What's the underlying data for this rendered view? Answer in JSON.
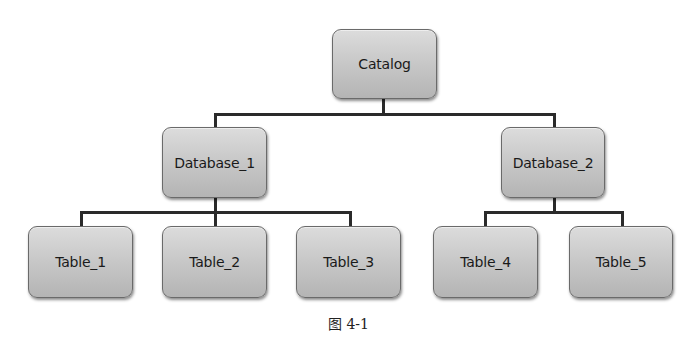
{
  "diagram": {
    "type": "tree",
    "root": {
      "label": "Catalog",
      "children": [
        {
          "label": "Database_1",
          "children": [
            {
              "label": "Table_1"
            },
            {
              "label": "Table_2"
            },
            {
              "label": "Table_3"
            }
          ]
        },
        {
          "label": "Database_2",
          "children": [
            {
              "label": "Table_4"
            },
            {
              "label": "Table_5"
            }
          ]
        }
      ]
    },
    "nodes": {
      "catalog": "Catalog",
      "database_1": "Database_1",
      "database_2": "Database_2",
      "table_1": "Table_1",
      "table_2": "Table_2",
      "table_3": "Table_3",
      "table_4": "Table_4",
      "table_5": "Table_5"
    },
    "caption": "图 4-1",
    "colors": {
      "node_fill_top": "#dcdcdc",
      "node_fill_bottom": "#b4b4b4",
      "node_border": "#6a6a6a",
      "connector": "#2a2a2a",
      "text": "#1a1a1a"
    }
  }
}
